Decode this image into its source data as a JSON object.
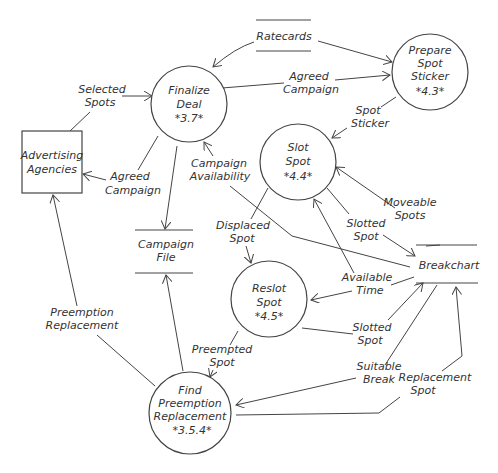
{
  "diagram": {
    "type": "data-flow-diagram",
    "processes": [
      {
        "id": "p37",
        "name": [
          "Finalize",
          "Deal"
        ],
        "number": "*3.7*"
      },
      {
        "id": "p43",
        "name": [
          "Prepare",
          "Spot",
          "Sticker"
        ],
        "number": "*4.3*"
      },
      {
        "id": "p44",
        "name": [
          "Slot",
          "Spot"
        ],
        "number": "*4.4*"
      },
      {
        "id": "p45",
        "name": [
          "Reslot",
          "Spot"
        ],
        "number": "*4.5*"
      },
      {
        "id": "p354",
        "name": [
          "Find",
          "Preemption",
          "Replacement"
        ],
        "number": "*3.5.4*"
      }
    ],
    "external_entities": [
      {
        "id": "agencies",
        "name": [
          "Advertising",
          "Agencies"
        ]
      }
    ],
    "data_stores": [
      {
        "id": "ratecards",
        "name": [
          "Ratecards"
        ]
      },
      {
        "id": "campaignfile",
        "name": [
          "Campaign",
          "File"
        ]
      },
      {
        "id": "breakchart",
        "name": [
          "Breakchart"
        ]
      }
    ],
    "flows": [
      {
        "label": [
          "Selected",
          "Spots"
        ],
        "from": "agencies",
        "to": "p37"
      },
      {
        "label": [
          "Agreed",
          "Campaign"
        ],
        "from": "p37",
        "to": "agencies"
      },
      {
        "label": [
          "Agreed",
          "Campaign"
        ],
        "from": "p37",
        "to": "p43"
      },
      {
        "label": [],
        "from": "ratecards",
        "to": "p37"
      },
      {
        "label": [],
        "from": "ratecards",
        "to": "p43"
      },
      {
        "label": [
          "Spot",
          "Sticker"
        ],
        "from": "p43",
        "to": "p44"
      },
      {
        "label": [],
        "from": "p37",
        "to": "campaignfile"
      },
      {
        "label": [
          "Campaign",
          "Availability"
        ],
        "from": "breakchart",
        "to": "p37"
      },
      {
        "label": [
          "Moveable",
          "Spots"
        ],
        "from": "breakchart",
        "to": "p44"
      },
      {
        "label": [
          "Slotted",
          "Spot"
        ],
        "from": "p44",
        "to": "breakchart"
      },
      {
        "label": [
          "Displaced",
          "Spot"
        ],
        "from": "p44",
        "to": "p45"
      },
      {
        "label": [
          "Available",
          "Time"
        ],
        "from": "breakchart",
        "to": "p44"
      },
      {
        "label": [
          "Available",
          "Time"
        ],
        "from": "breakchart",
        "to": "p45"
      },
      {
        "label": [
          "Slotted",
          "Spot"
        ],
        "from": "p45",
        "to": "breakchart"
      },
      {
        "label": [
          "Preempted",
          "Spot"
        ],
        "from": "p45",
        "to": "p354"
      },
      {
        "label": [
          "Suitable",
          "Break"
        ],
        "from": "breakchart",
        "to": "p354"
      },
      {
        "label": [
          "Replacement",
          "Spot"
        ],
        "from": "p354",
        "to": "breakchart"
      },
      {
        "label": [],
        "from": "p354",
        "to": "campaignfile"
      },
      {
        "label": [
          "Preemption",
          "Replacement"
        ],
        "from": "p354",
        "to": "agencies"
      }
    ]
  },
  "text": {
    "finalize_1": "Finalize",
    "finalize_2": "Deal",
    "finalize_n": "*3.7*",
    "prepare_1": "Prepare",
    "prepare_2": "Spot",
    "prepare_3": "Sticker",
    "prepare_n": "*4.3*",
    "slot_1": "Slot",
    "slot_2": "Spot",
    "slot_n": "*4.4*",
    "reslot_1": "Reslot",
    "reslot_2": "Spot",
    "reslot_n": "*4.5*",
    "find_1": "Find",
    "find_2": "Preemption",
    "find_3": "Replacement",
    "find_n": "*3.5.4*",
    "agencies_1": "Advertising",
    "agencies_2": "Agencies",
    "ratecards": "Ratecards",
    "campaignfile_1": "Campaign",
    "campaignfile_2": "File",
    "breakchart": "Breakchart",
    "selected_1": "Selected",
    "selected_2": "Spots",
    "agreed_a1": "Agreed",
    "agreed_a2": "Campaign",
    "agreed_b1": "Agreed",
    "agreed_b2": "Campaign",
    "spotsticker_1": "Spot",
    "spotsticker_2": "Sticker",
    "campavail_1": "Campaign",
    "campavail_2": "Availability",
    "moveable_1": "Moveable",
    "moveable_2": "Spots",
    "slotted_a1": "Slotted",
    "slotted_a2": "Spot",
    "displaced_1": "Displaced",
    "displaced_2": "Spot",
    "available_1": "Available",
    "available_2": "Time",
    "slotted_b1": "Slotted",
    "slotted_b2": "Spot",
    "preempted_1": "Preempted",
    "preempted_2": "Spot",
    "suitable_1": "Suitable",
    "suitable_2": "Break",
    "replacement_1": "Replacement",
    "replacement_2": "Spot",
    "preemptrep_1": "Preemption",
    "preemptrep_2": "Replacement"
  }
}
